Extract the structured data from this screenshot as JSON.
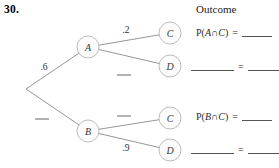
{
  "problem": {
    "number": "30."
  },
  "header": {
    "outcome_label": "Outcome"
  },
  "tree": {
    "root": {
      "x": 26,
      "y": 89
    },
    "nodes": [
      {
        "id": "A",
        "label": "A",
        "x": 88,
        "y": 47
      },
      {
        "id": "B",
        "label": "B",
        "x": 88,
        "y": 131
      },
      {
        "id": "C1",
        "label": "C",
        "x": 170,
        "y": 33
      },
      {
        "id": "D1",
        "label": "D",
        "x": 170,
        "y": 66
      },
      {
        "id": "C2",
        "label": "C",
        "x": 170,
        "y": 118
      },
      {
        "id": "D2",
        "label": "D",
        "x": 170,
        "y": 150
      }
    ],
    "branches": [
      {
        "id": "root-to-A",
        "from": "root",
        "to": "A",
        "probability": ".6",
        "label_x": 44,
        "label_y": 70
      },
      {
        "id": "root-to-B",
        "from": "root",
        "to": "B",
        "probability": "",
        "label_x": 42,
        "label_y": 119
      },
      {
        "id": "A-to-C",
        "from": "A",
        "to": "C1",
        "probability": ".2",
        "label_x": 126,
        "label_y": 33
      },
      {
        "id": "A-to-D",
        "from": "A",
        "to": "D1",
        "probability": "",
        "label_x": 124,
        "label_y": 75
      },
      {
        "id": "B-to-C",
        "from": "B",
        "to": "C2",
        "probability": "",
        "label_x": 124,
        "label_y": 116
      },
      {
        "id": "B-to-D",
        "from": "B",
        "to": "D2",
        "probability": ".9",
        "label_x": 126,
        "label_y": 151
      }
    ],
    "node_radius": 11,
    "node_fill": "#fbfbfb",
    "node_stroke": "#b5b5b5",
    "line_color": "#8a8a8a"
  },
  "outcomes": [
    {
      "id": "outcome-a-c",
      "type": "expression",
      "prefix": "P(",
      "event_first": "A",
      "operator": "∩",
      "event_second": "C",
      "suffix": ")",
      "equals": "=",
      "value": "",
      "top": 27
    },
    {
      "id": "outcome-a-d",
      "type": "blanks",
      "equals": "=",
      "top": 61
    },
    {
      "id": "outcome-b-c",
      "type": "expression",
      "prefix": "P(",
      "event_first": "B",
      "operator": "∩",
      "event_second": "C",
      "suffix": ")",
      "equals": "=",
      "value": "",
      "top": 111
    },
    {
      "id": "outcome-b-d",
      "type": "blanks",
      "equals": "=",
      "top": 144
    }
  ]
}
